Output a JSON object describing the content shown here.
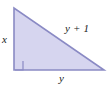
{
  "figure": {
    "type": "right-triangle",
    "background_color": "#ffffff",
    "fill_color": "#d6d5ef",
    "stroke_color": "#8a8ac4",
    "label_color": "#1a1a1a"
  },
  "geometry": {
    "apex": {
      "x": 14,
      "y": 8
    },
    "right_angle_vertex": {
      "x": 14,
      "y": 70
    },
    "bottom_right_vertex": {
      "x": 104,
      "y": 70
    },
    "right_angle_marker_size": 9
  },
  "labels": {
    "vertical_leg": "x",
    "hypotenuse": "y + 1",
    "horizontal_leg": "y"
  }
}
